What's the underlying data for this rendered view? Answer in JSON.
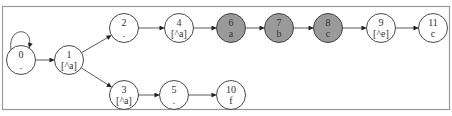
{
  "diagram": {
    "type": "finite-state-automaton",
    "colors": {
      "node_fill": "#ffffff",
      "node_highlight_fill": "#9a9a9a",
      "stroke": "#333333",
      "frame": "#999999"
    },
    "nodes": [
      {
        "id": "0",
        "label": ".",
        "x": 21,
        "y": 60,
        "highlighted": false
      },
      {
        "id": "1",
        "label": "[^a]",
        "x": 69,
        "y": 60,
        "highlighted": false
      },
      {
        "id": "2",
        "label": ".",
        "x": 124,
        "y": 28,
        "highlighted": false
      },
      {
        "id": "4",
        "label": "[^a]",
        "x": 179,
        "y": 28,
        "highlighted": false
      },
      {
        "id": "6",
        "label": "a",
        "x": 231,
        "y": 28,
        "highlighted": true
      },
      {
        "id": "7",
        "label": "b",
        "x": 279,
        "y": 28,
        "highlighted": true
      },
      {
        "id": "8",
        "label": "c",
        "x": 328,
        "y": 28,
        "highlighted": true
      },
      {
        "id": "9",
        "label": "[^e]",
        "x": 381,
        "y": 28,
        "highlighted": false
      },
      {
        "id": "11",
        "label": "c",
        "x": 433,
        "y": 28,
        "highlighted": false
      },
      {
        "id": "3",
        "label": "[^a]",
        "x": 124,
        "y": 95,
        "highlighted": false
      },
      {
        "id": "5",
        "label": ".",
        "x": 174,
        "y": 95,
        "highlighted": false
      },
      {
        "id": "10",
        "label": "f",
        "x": 231,
        "y": 95,
        "highlighted": false
      }
    ],
    "edges": [
      {
        "from": "0",
        "to": "0",
        "self_loop": true
      },
      {
        "from": "0",
        "to": "1"
      },
      {
        "from": "1",
        "to": "2"
      },
      {
        "from": "1",
        "to": "3"
      },
      {
        "from": "2",
        "to": "4"
      },
      {
        "from": "4",
        "to": "6"
      },
      {
        "from": "6",
        "to": "7"
      },
      {
        "from": "7",
        "to": "8"
      },
      {
        "from": "8",
        "to": "9"
      },
      {
        "from": "9",
        "to": "11"
      },
      {
        "from": "3",
        "to": "5"
      },
      {
        "from": "5",
        "to": "10"
      }
    ]
  }
}
